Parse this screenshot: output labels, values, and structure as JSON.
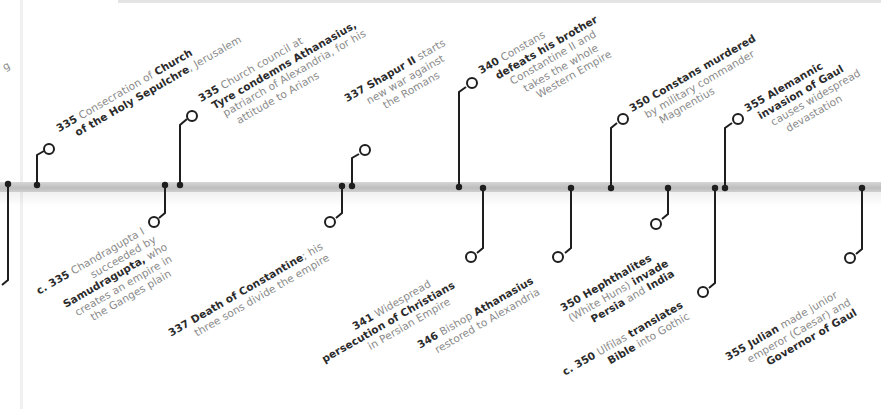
{
  "timeline": {
    "above": [
      {
        "id": "e1",
        "year": "335",
        "pre": "Consecration of ",
        "bold1": "Church",
        "line2_bold": "of the Holy Sepulchre",
        "line2_rest": ", Jerusalem"
      },
      {
        "id": "e2",
        "year": "335",
        "line1_rest": " Church council at",
        "line2_bold": "Tyre condemns Athanasius,",
        "line3": "patriarch of Alexandria, for his",
        "line4": "attitude to Arians"
      },
      {
        "id": "e3",
        "year": "337",
        "bold1": " Shapur II",
        "rest1": " starts",
        "line2": "new war against",
        "line3": "the Romans"
      },
      {
        "id": "e4",
        "year": "340",
        "rest1": " Constans",
        "line2_bold": "defeats his brother",
        "line3": "Constantine II and",
        "line4": "takes the whole",
        "line5": "Western Empire"
      },
      {
        "id": "e5",
        "year": "350",
        "bold1": " Constans murdered",
        "line2": "by military commander",
        "line3": "Magnentius"
      },
      {
        "id": "e6",
        "year": "355",
        "bold1": " Alemannic",
        "line2_bold": "invasion of Gaul",
        "line3": "causes widespread",
        "line4": "devastation"
      }
    ],
    "below": [
      {
        "id": "b1",
        "year": "c. 335",
        "rest1": " Chandragupta I",
        "line2": "succeeded by",
        "line3_bold": "Samudragupta,",
        "line3_rest": " who",
        "line4": "creates an empire in",
        "line5": "the Ganges plain"
      },
      {
        "id": "b2",
        "year": "337",
        "bold1": " Death of Constantine",
        "rest1": "; his",
        "line2": "three sons divide the empire"
      },
      {
        "id": "b3",
        "year": "341",
        "rest1": " Widespread",
        "line2_bold": "persecution of Christians",
        "line3": "in Persian Empire"
      },
      {
        "id": "b4",
        "year": "346",
        "rest1": " Bishop ",
        "bold1": "Athanasius",
        "line2": "restored to Alexandria"
      },
      {
        "id": "b5",
        "year": "350",
        "bold1": " Hephthalites",
        "line2_rest": "(White Huns) ",
        "line2_bold": "invade",
        "line3_bold": "Persia",
        "line3_rest": " and ",
        "line3_bold2": "India"
      },
      {
        "id": "b6",
        "year": "c. 350",
        "rest1": " Ulfilas ",
        "bold1": "translates",
        "line2_bold": "Bible",
        "line2_rest": " into Gothic"
      },
      {
        "id": "b7",
        "year": "355",
        "bold1": " Julian",
        "rest1": " made junior",
        "line2": "emperor (Caesar) and",
        "line3_bold": "Governor of Gaul"
      }
    ],
    "partial_left_text": "g"
  },
  "colors": {
    "line": "#1e1e1e",
    "bar": "#c8c8c8",
    "text_light": "#8a8a8a",
    "text_bold": "#2b2b2b"
  }
}
